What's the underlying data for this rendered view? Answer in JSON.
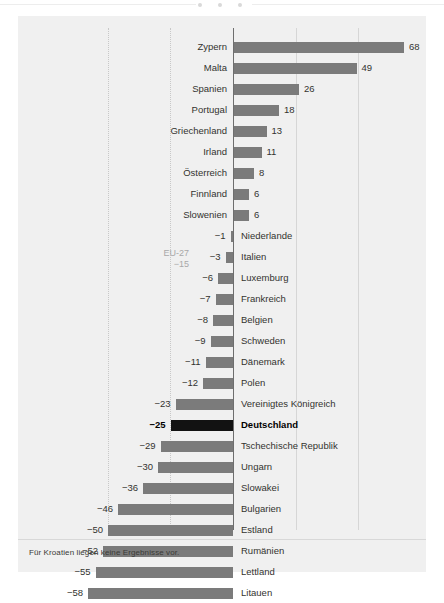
{
  "figure": {
    "footnote": "Für Kroatien liegen keine Ergebnisse vor.",
    "bar_color": "#7b7b7b",
    "highlight_color": "#121212",
    "panel_color": "#f0f0f0",
    "annotation_color": "#a8a8a8"
  },
  "annotation": {
    "label": "EU-27",
    "value": "−15"
  },
  "chart_data": {
    "type": "bar",
    "orientation": "horizontal",
    "title": "",
    "subtitle": "",
    "xlabel": "",
    "ylabel": "",
    "xlim": [
      -60,
      70
    ],
    "grid": true,
    "gridlines": [
      -50,
      -25,
      25,
      50
    ],
    "legend": "none",
    "highlight": "Deutschland",
    "reference_line": {
      "label": "EU-27",
      "value": -15
    },
    "note": "Für Kroatien liegen keine Ergebnisse vor.",
    "categories": [
      "Zypern",
      "Malta",
      "Spanien",
      "Portugal",
      "Griechenland",
      "Irland",
      "Österreich",
      "Finnland",
      "Slowenien",
      "Niederlande",
      "Italien",
      "Luxemburg",
      "Frankreich",
      "Belgien",
      "Schweden",
      "Dänemark",
      "Polen",
      "Vereinigtes Königreich",
      "Deutschland",
      "Tschechische Republik",
      "Ungarn",
      "Slowakei",
      "Bulgarien",
      "Estland",
      "Rumänien",
      "Lettland",
      "Litauen"
    ],
    "values": [
      68,
      49,
      26,
      18,
      13,
      11,
      8,
      6,
      6,
      -1,
      -3,
      -6,
      -7,
      -8,
      -9,
      -11,
      -12,
      -23,
      -25,
      -29,
      -30,
      -36,
      -46,
      -50,
      -52,
      -55,
      -58
    ],
    "value_labels": [
      "68",
      "49",
      "26",
      "18",
      "13",
      "11",
      "8",
      "6",
      "6",
      "−1",
      "−3",
      "−6",
      "−7",
      "−8",
      "−9",
      "−11",
      "−12",
      "−23",
      "−25",
      "−29",
      "−30",
      "−36",
      "−46",
      "−50",
      "−52",
      "−55",
      "−58"
    ]
  }
}
